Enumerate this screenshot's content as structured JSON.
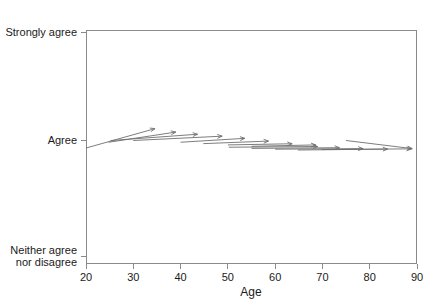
{
  "chart_data": {
    "type": "line",
    "title": "",
    "xlabel": "Age",
    "ylabel": "",
    "xlim": [
      20,
      90
    ],
    "ylim": [
      0,
      2
    ],
    "grid": false,
    "legend": "none",
    "x_ticks": [
      20,
      30,
      40,
      50,
      60,
      70,
      80,
      90
    ],
    "x_tick_labels": [
      "20",
      "30",
      "40",
      "50",
      "60",
      "70",
      "80",
      "90"
    ],
    "y_ticks": [
      0,
      1,
      2
    ],
    "y_tick_labels": [
      "Neither agree\nnor disagree",
      "Agree",
      "Strongly agree"
    ],
    "y_tick_label_bottom_line1": "Neither agree",
    "y_tick_label_bottom_line2": "nor disagree",
    "y_tick_label_middle": "Agree",
    "y_tick_label_top": "Strongly agree",
    "series": [
      {
        "name": "age-trajectory-arrows",
        "marker": "arrow",
        "description": "Each arrow runs from a baseline age/agreement position to a projected age/agreement position.",
        "arrows": [
          {
            "x0": 20.0,
            "y0": 0.935,
            "x1": 34.6,
            "y1": 1.11
          },
          {
            "x0": 24.8,
            "y0": 0.985,
            "x1": 39.0,
            "y1": 1.078
          },
          {
            "x0": 25.2,
            "y0": 1.0,
            "x1": 43.6,
            "y1": 1.058
          },
          {
            "x0": 30.0,
            "y0": 1.0,
            "x1": 48.8,
            "y1": 1.04
          },
          {
            "x0": 40.0,
            "y0": 0.985,
            "x1": 53.6,
            "y1": 1.02
          },
          {
            "x0": 44.8,
            "y0": 0.973,
            "x1": 58.6,
            "y1": 0.995
          },
          {
            "x0": 50.0,
            "y0": 0.962,
            "x1": 63.6,
            "y1": 0.972
          },
          {
            "x0": 55.0,
            "y0": 0.95,
            "x1": 68.6,
            "y1": 0.962
          },
          {
            "x0": 50.2,
            "y0": 0.942,
            "x1": 69.0,
            "y1": 0.948
          },
          {
            "x0": 55.0,
            "y0": 0.932,
            "x1": 73.6,
            "y1": 0.938
          },
          {
            "x0": 60.0,
            "y0": 0.925,
            "x1": 78.6,
            "y1": 0.93
          },
          {
            "x0": 64.8,
            "y0": 0.918,
            "x1": 83.8,
            "y1": 0.926
          },
          {
            "x0": 69.8,
            "y0": 0.922,
            "x1": 88.8,
            "y1": 0.928
          },
          {
            "x0": 75.0,
            "y0": 1.0,
            "x1": 89.0,
            "y1": 0.93
          }
        ]
      }
    ],
    "axis_colors": {
      "frame": "#8a8a8a",
      "arrow": "#6e6e6e",
      "text": "#1a1a1a",
      "background": "#ffffff"
    }
  },
  "layout": {
    "plot_left_px": 86,
    "plot_right_px": 417,
    "plot_top_px": 30,
    "plot_bottom_px": 263
  }
}
